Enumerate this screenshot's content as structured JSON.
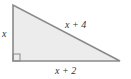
{
  "diagram": {
    "type": "right-triangle",
    "fill_color": "#ececec",
    "stroke_color": "#8a8a8a",
    "vertices": {
      "top": [
        13,
        5
      ],
      "right_angle": [
        13,
        61
      ],
      "bottom_right": [
        120,
        61
      ]
    },
    "labels": {
      "left_side": "x",
      "hypotenuse": "x + 4",
      "bottom_side": "x + 2"
    },
    "right_angle_marker": true
  }
}
